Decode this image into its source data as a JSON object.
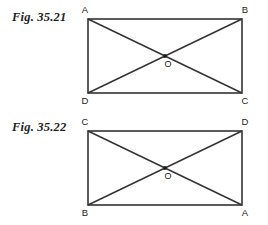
{
  "page": {
    "background_color": "#ffffff",
    "line_color": "#333333",
    "text_color": "#1a1a1a"
  },
  "figures": [
    {
      "caption": "Fig. 35.21",
      "shape": "rectangle-with-diagonals",
      "vertices": {
        "top_left": "A",
        "top_right": "B",
        "bottom_right": "C",
        "bottom_left": "D"
      },
      "center_label": "O",
      "diagonals": [
        "A-C",
        "B-D"
      ]
    },
    {
      "caption": "Fig. 35.22",
      "shape": "rectangle-with-diagonals",
      "vertices": {
        "top_left": "C",
        "top_right": "D",
        "bottom_right": "A",
        "bottom_left": "B"
      },
      "center_label": "O",
      "diagonals": [
        "C-A",
        "D-B"
      ]
    }
  ]
}
